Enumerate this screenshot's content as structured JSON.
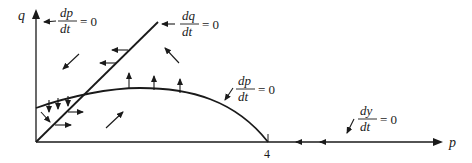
{
  "diagram": {
    "axes": {
      "x_label": "p",
      "y_label": "q",
      "x_tick": "4"
    },
    "nullclines": [
      {
        "id": "dp_dt_q_axis",
        "num": "dp",
        "den": "dt",
        "eq": "= 0"
      },
      {
        "id": "dq_dt_line",
        "num": "dq",
        "den": "dt",
        "eq": "= 0"
      },
      {
        "id": "dp_dt_curve",
        "num": "dp",
        "den": "dt",
        "eq": "= 0"
      },
      {
        "id": "dy_dt_p_axis",
        "num": "dy",
        "den": "dt",
        "eq": "= 0"
      }
    ],
    "colors": {
      "ink": "#1a1a1a",
      "background": "#ffffff"
    }
  }
}
